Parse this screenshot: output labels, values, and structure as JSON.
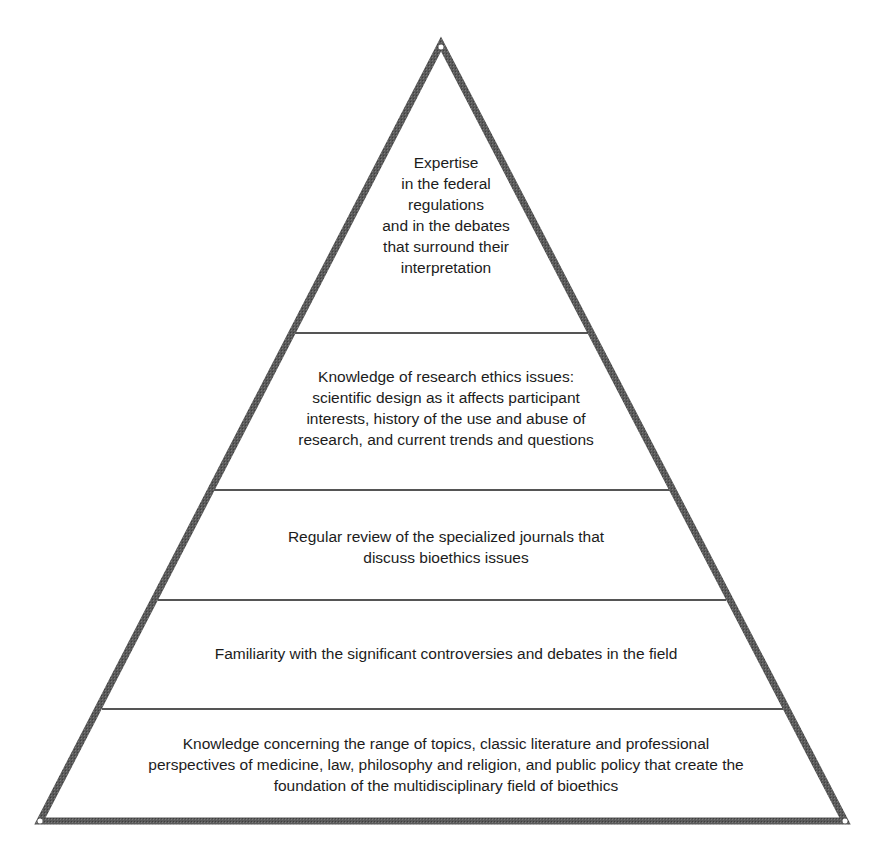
{
  "diagram": {
    "type": "pyramid",
    "levels_top_to_bottom": 5,
    "colors": {
      "outline": "#4d4d4d",
      "divider": "#555555",
      "fill": "#ffffff",
      "text": "#1c1c1c"
    },
    "tiers": [
      {
        "level": 1,
        "position": "apex",
        "text": "Expertise\nin the federal\nregulations\nand in the debates\nthat surround their\ninterpretation"
      },
      {
        "level": 2,
        "position": "upper-middle",
        "text": "Knowledge of research ethics issues:\nscientific design as it affects participant\ninterests, history of the use and abuse of\nresearch, and current trends and questions"
      },
      {
        "level": 3,
        "position": "middle",
        "text": "Regular review of the specialized journals that\ndiscuss bioethics issues"
      },
      {
        "level": 4,
        "position": "lower-middle",
        "text": "Familiarity with the significant controversies and debates in the field"
      },
      {
        "level": 5,
        "position": "base",
        "text": "Knowledge concerning the range of topics, classic literature and professional\nperspectives of medicine, law, philosophy and religion, and public policy that create the\nfoundation of the multidisciplinary field of bioethics"
      }
    ]
  }
}
